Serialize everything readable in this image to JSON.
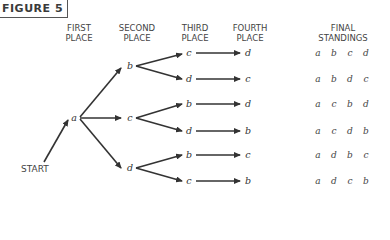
{
  "figure_label": "FIGURE 5",
  "headers": {
    "first": [
      "FIRST",
      "PLACE"
    ],
    "second": [
      "SECOND",
      "PLACE"
    ],
    "third": [
      "THIRD",
      "PLACE"
    ],
    "fourth": [
      "FOURTH",
      "PLACE"
    ],
    "final": [
      "FINAL",
      "STANDINGS"
    ]
  },
  "start_label": "START",
  "tree": {
    "first": "a",
    "second": [
      "b",
      "c",
      "d"
    ],
    "third": [
      "c",
      "d",
      "b",
      "d",
      "b",
      "c"
    ],
    "fourth": [
      "d",
      "c",
      "d",
      "b",
      "c",
      "b"
    ]
  },
  "final_standings": [
    [
      "a",
      "b",
      "c",
      "d"
    ],
    [
      "a",
      "b",
      "d",
      "c"
    ],
    [
      "a",
      "c",
      "b",
      "d"
    ],
    [
      "a",
      "c",
      "d",
      "b"
    ],
    [
      "a",
      "d",
      "b",
      "c"
    ],
    [
      "a",
      "d",
      "c",
      "b"
    ]
  ]
}
